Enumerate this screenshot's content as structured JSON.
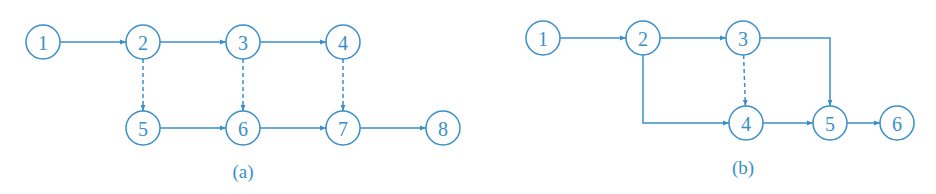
{
  "colors": {
    "stroke": "#3a8fc9",
    "text": "#3a8fc9",
    "background": "#ffffff"
  },
  "diagrams": [
    {
      "caption": "(a)",
      "caption_pos": [
        243,
        178
      ],
      "nodes": [
        {
          "id": "1",
          "label": "1",
          "x": 43,
          "y": 42
        },
        {
          "id": "2",
          "label": "2",
          "x": 143,
          "y": 42
        },
        {
          "id": "3",
          "label": "3",
          "x": 243,
          "y": 42
        },
        {
          "id": "4",
          "label": "4",
          "x": 343,
          "y": 42
        },
        {
          "id": "5",
          "label": "5",
          "x": 143,
          "y": 128
        },
        {
          "id": "6",
          "label": "6",
          "x": 243,
          "y": 128
        },
        {
          "id": "7",
          "label": "7",
          "x": 343,
          "y": 128
        },
        {
          "id": "8",
          "label": "8",
          "x": 443,
          "y": 128
        }
      ],
      "edges": [
        {
          "from": "1",
          "to": "2",
          "style": "solid"
        },
        {
          "from": "2",
          "to": "3",
          "style": "solid"
        },
        {
          "from": "3",
          "to": "4",
          "style": "solid"
        },
        {
          "from": "2",
          "to": "5",
          "style": "dashed"
        },
        {
          "from": "3",
          "to": "6",
          "style": "dashed"
        },
        {
          "from": "4",
          "to": "7",
          "style": "dashed"
        },
        {
          "from": "5",
          "to": "6",
          "style": "solid"
        },
        {
          "from": "6",
          "to": "7",
          "style": "solid"
        },
        {
          "from": "7",
          "to": "8",
          "style": "solid"
        }
      ]
    },
    {
      "caption": "(b)",
      "caption_pos": [
        743,
        174
      ],
      "nodes": [
        {
          "id": "1",
          "label": "1",
          "x": 543,
          "y": 38
        },
        {
          "id": "2",
          "label": "2",
          "x": 643,
          "y": 38
        },
        {
          "id": "3",
          "label": "3",
          "x": 743,
          "y": 38
        },
        {
          "id": "4",
          "label": "4",
          "x": 746,
          "y": 123
        },
        {
          "id": "5",
          "label": "5",
          "x": 830,
          "y": 123
        },
        {
          "id": "6",
          "label": "6",
          "x": 897,
          "y": 123
        }
      ],
      "edges": [
        {
          "from": "1",
          "to": "2",
          "style": "solid"
        },
        {
          "from": "2",
          "to": "3",
          "style": "solid"
        },
        {
          "from": "3",
          "to": "4",
          "style": "dashed"
        },
        {
          "from": "2",
          "to": "4",
          "style": "solid",
          "route": "down-right"
        },
        {
          "from": "3",
          "to": "5",
          "style": "solid",
          "route": "right-down"
        },
        {
          "from": "4",
          "to": "5",
          "style": "solid"
        },
        {
          "from": "5",
          "to": "6",
          "style": "solid"
        }
      ]
    }
  ]
}
